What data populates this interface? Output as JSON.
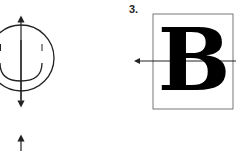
{
  "figure": {
    "left_panel": {
      "shape": "smiley-face",
      "axis": "vertical-arrow",
      "second_arrow": "partial-vertical-arrow"
    },
    "right_panel": {
      "label": "3.",
      "letter": "B",
      "axis": "horizontal-arrow"
    },
    "colors": {
      "line": "#222222",
      "background": "#ffffff"
    }
  }
}
